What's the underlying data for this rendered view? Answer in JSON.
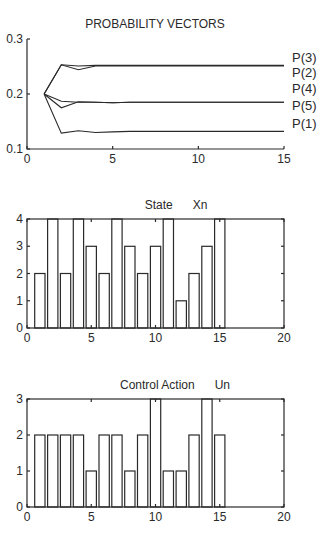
{
  "chart_data": [
    {
      "type": "line",
      "title": "PROBABILITY VECTORS",
      "xlabel": "",
      "ylabel": "",
      "xlim": [
        0,
        15
      ],
      "ylim": [
        0.1,
        0.3
      ],
      "xticks": [
        0,
        5,
        10,
        15
      ],
      "yticks": [
        0.1,
        0.2,
        0.3
      ],
      "ytick_labels": [
        "0.1",
        "0.2",
        "0.3"
      ],
      "grid": false,
      "legend_position": "right (inline labels)",
      "x": [
        1,
        2,
        3,
        4,
        5,
        6,
        7,
        8,
        9,
        10,
        11,
        12,
        13,
        14,
        15
      ],
      "series": [
        {
          "name": "P(3)",
          "values": [
            0.2,
            0.253,
            0.251,
            0.252,
            0.252,
            0.252,
            0.252,
            0.252,
            0.252,
            0.252,
            0.252,
            0.252,
            0.252,
            0.252,
            0.252
          ]
        },
        {
          "name": "P(2)",
          "values": [
            0.2,
            0.253,
            0.244,
            0.251,
            0.251,
            0.251,
            0.251,
            0.251,
            0.251,
            0.251,
            0.251,
            0.251,
            0.251,
            0.251,
            0.251
          ]
        },
        {
          "name": "P(4)",
          "values": [
            0.2,
            0.187,
            0.185,
            0.185,
            0.184,
            0.185,
            0.185,
            0.185,
            0.185,
            0.185,
            0.185,
            0.185,
            0.185,
            0.185,
            0.185
          ]
        },
        {
          "name": "P(5)",
          "values": [
            0.2,
            0.175,
            0.186,
            0.185,
            0.184,
            0.185,
            0.185,
            0.185,
            0.185,
            0.185,
            0.185,
            0.185,
            0.185,
            0.185,
            0.185
          ]
        },
        {
          "name": "P(1)",
          "values": [
            0.2,
            0.129,
            0.133,
            0.13,
            0.131,
            0.132,
            0.132,
            0.132,
            0.132,
            0.132,
            0.132,
            0.132,
            0.132,
            0.132,
            0.132
          ]
        }
      ],
      "legend_order": [
        "P(3)",
        "P(2)",
        "P(4)",
        "P(5)",
        "P(1)"
      ]
    },
    {
      "type": "bar",
      "title": "State      Xn",
      "xlabel": "",
      "ylabel": "",
      "xlim": [
        0,
        20
      ],
      "ylim": [
        0,
        4
      ],
      "xticks": [
        0,
        5,
        10,
        15,
        20
      ],
      "yticks": [
        0,
        1,
        2,
        3,
        4
      ],
      "grid": false,
      "categories": [
        1,
        2,
        3,
        4,
        5,
        6,
        7,
        8,
        9,
        10,
        11,
        12,
        13,
        14,
        15
      ],
      "values": [
        2,
        4,
        2,
        4,
        3,
        2,
        4,
        3,
        2,
        3,
        4,
        1,
        2,
        3,
        4
      ]
    },
    {
      "type": "bar",
      "title": "Control Action      Un",
      "xlabel": "",
      "ylabel": "",
      "xlim": [
        0,
        20
      ],
      "ylim": [
        0,
        3
      ],
      "xticks": [
        0,
        5,
        10,
        15,
        20
      ],
      "yticks": [
        0,
        1,
        2,
        3
      ],
      "grid": false,
      "categories": [
        1,
        2,
        3,
        4,
        5,
        6,
        7,
        8,
        9,
        10,
        11,
        12,
        13,
        14,
        15
      ],
      "values": [
        2,
        2,
        2,
        2,
        1,
        2,
        2,
        1,
        2,
        3,
        1,
        1,
        2,
        3,
        2
      ]
    }
  ]
}
